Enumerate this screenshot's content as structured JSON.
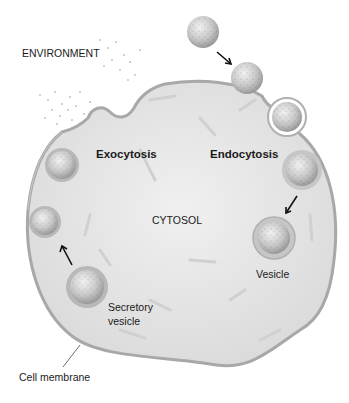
{
  "labels": {
    "environment": "ENVIRONMENT",
    "exocytosis": "Exocytosis",
    "endocytosis": "Endocytosis",
    "cytosol": "CYTOSOL",
    "vesicle": "Vesicle",
    "secretory_vesicle_line1": "Secretory",
    "secretory_vesicle_line2": "vesicle",
    "cell_membrane": "Cell membrane"
  },
  "colors": {
    "cytosol_fill": "#e4e4e4",
    "membrane": "#a8a8a8",
    "vesicle_fill": "#cfcfcf",
    "text": "#1a1a1a",
    "arrow": "#111111"
  }
}
